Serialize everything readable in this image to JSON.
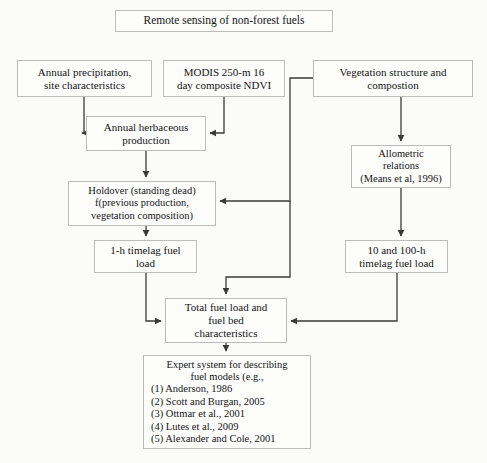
{
  "title": {
    "text": "Remote sensing of non-forest fuels"
  },
  "nodes": {
    "precipitation": {
      "lines": [
        "Annual precipitation,",
        "site characteristics"
      ]
    },
    "modis": {
      "lines": [
        "MODIS 250-m 16",
        "day composite NDVI"
      ]
    },
    "vegetation": {
      "lines": [
        "Vegetation structure and",
        "compostion"
      ]
    },
    "annual_herbaceous": {
      "lines": [
        "Annual herbaceous",
        "production"
      ]
    },
    "allometric": {
      "lines": [
        "Allometric",
        "relations",
        "(Means et al, 1996)"
      ]
    },
    "holdover": {
      "lines": [
        "Holdover (standing dead)",
        "f(previous production,",
        "vegetation composition)"
      ]
    },
    "one_hour": {
      "lines": [
        "1-h timelag fuel",
        "load"
      ]
    },
    "ten_hundred_hour": {
      "lines": [
        "10 and 100-h",
        "timelag fuel load"
      ]
    },
    "total_fuel": {
      "lines": [
        "Total fuel load and",
        "fuel bed",
        "characteristics"
      ]
    },
    "expert_system": {
      "heading": [
        "Expert system for describing",
        "fuel models (e.g.,"
      ],
      "items": [
        "(1) Anderson, 1986",
        "(2) Scott and Burgan, 2005",
        "(3) Ottmar et al., 2001",
        "(4) Lutes et al., 2009",
        "(5) Alexander and Cole, 2001"
      ]
    }
  },
  "colors": {
    "page_background": "#fbfbfa",
    "box_background": "#fdfdfc",
    "box_border": "#bcbcbc",
    "connector": "#3a3a3a",
    "text": "#141414"
  },
  "connectors": [
    {
      "from": "precipitation",
      "to": "annual_herbaceous"
    },
    {
      "from": "modis",
      "to": "annual_herbaceous"
    },
    {
      "from": "vegetation",
      "to": "allometric"
    },
    {
      "from": "vegetation",
      "to": "holdover"
    },
    {
      "from": "vegetation",
      "to": "total_fuel"
    },
    {
      "from": "annual_herbaceous",
      "to": "holdover"
    },
    {
      "from": "allometric",
      "to": "ten_hundred_hour"
    },
    {
      "from": "holdover",
      "to": "one_hour"
    },
    {
      "from": "one_hour",
      "to": "total_fuel"
    },
    {
      "from": "ten_hundred_hour",
      "to": "total_fuel"
    },
    {
      "from": "total_fuel",
      "to": "expert_system"
    }
  ]
}
